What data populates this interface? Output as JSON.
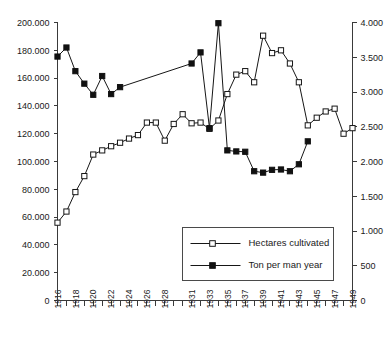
{
  "chart_data": {
    "type": "line",
    "title": "",
    "subtitle": "",
    "xlabel": "",
    "ylabel": "",
    "y2label": "",
    "grid": false,
    "legend_position": "inside-bottom-right",
    "x": [
      1916,
      1917,
      1918,
      1919,
      1920,
      1921,
      1922,
      1923,
      1924,
      1925,
      1926,
      1927,
      1928,
      1929,
      1930,
      1931,
      1932,
      1933,
      1934,
      1935,
      1936,
      1937,
      1938,
      1939,
      1940,
      1941,
      1942,
      1943,
      1944,
      1945,
      1946,
      1947,
      1948,
      1949
    ],
    "xtick_labels": [
      "1916",
      "1918",
      "1920",
      "1922",
      "1924",
      "1926",
      "1928",
      "1931",
      "1933",
      "1935",
      "1937",
      "1939",
      "1941",
      "1943",
      "1945",
      "1947",
      "1949"
    ],
    "xlim": [
      1916,
      1949
    ],
    "ylim": [
      0,
      200000
    ],
    "ytick_labels": [
      "0",
      "20.000",
      "40.000",
      "60.000",
      "80.000",
      "100.000",
      "120.000",
      "140.000",
      "160.000",
      "180.000",
      "200.000"
    ],
    "ytick_values": [
      0,
      20000,
      40000,
      60000,
      80000,
      100000,
      120000,
      140000,
      160000,
      180000,
      200000
    ],
    "y2lim": [
      0,
      4000
    ],
    "y2tick_labels": [
      "0",
      "500",
      "1.000",
      "1.500",
      "2.000",
      "2.500",
      "3.000",
      "3.500",
      "4.000"
    ],
    "y2tick_values": [
      0,
      500,
      1000,
      1500,
      2000,
      2500,
      3000,
      3500,
      4000
    ],
    "series": [
      {
        "name": "Hectares cultivated",
        "axis": "left",
        "marker": "open-square",
        "x": [
          1916,
          1917,
          1918,
          1919,
          1920,
          1921,
          1922,
          1923,
          1924,
          1925,
          1926,
          1927,
          1928,
          1929,
          1930,
          1931,
          1932,
          1933,
          1934,
          1935,
          1936,
          1937,
          1938,
          1939,
          1940,
          1941,
          1942,
          1943,
          1944,
          1945,
          1946,
          1947,
          1948,
          1949
        ],
        "values": [
          56000,
          64000,
          78000,
          89500,
          105000,
          108000,
          111000,
          113500,
          116500,
          119000,
          128000,
          128000,
          115000,
          127000,
          134000,
          127500,
          128000,
          123500,
          129500,
          148500,
          162500,
          165000,
          157000,
          190500,
          178000,
          180000,
          170500,
          157000,
          126000,
          131500,
          136000,
          138000,
          120000,
          124000
        ]
      },
      {
        "name": "Ton per man year",
        "axis": "right",
        "marker": "filled-square",
        "x": [
          1916,
          1917,
          1918,
          1919,
          1920,
          1921,
          1922,
          1923,
          1931,
          1932,
          1933,
          1934,
          1935,
          1936,
          1937,
          1938,
          1939,
          1940,
          1941,
          1942,
          1943,
          1944
        ],
        "values": [
          3510,
          3640,
          3300,
          3120,
          2960,
          3230,
          2970,
          3070,
          3410,
          3570,
          2480,
          3990,
          2160,
          2145,
          2140,
          1860,
          1840,
          1880,
          1885,
          1860,
          1960,
          2290
        ]
      }
    ],
    "legend": [
      {
        "label": "Hectares cultivated",
        "marker": "open-square"
      },
      {
        "label": "Ton per man year",
        "marker": "filled-square"
      }
    ]
  },
  "colors": {
    "axis": "#3a3a3a",
    "series_line": "#161616",
    "marker_open_fill": "#ffffff",
    "marker_filled_fill": "#111111",
    "legend_border": "#4a4a4a",
    "background": "#ffffff"
  }
}
